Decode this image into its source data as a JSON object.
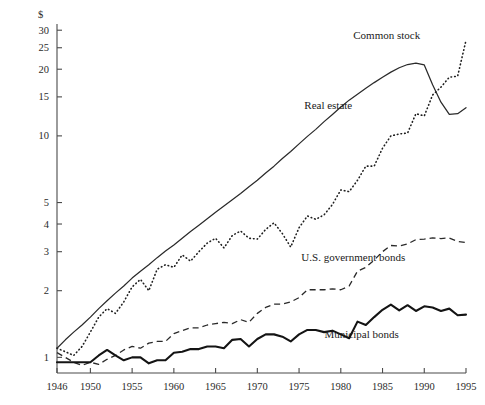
{
  "chart_data": {
    "type": "line",
    "title": "",
    "subtitle": "",
    "xlabel": "",
    "ylabel": "$",
    "yscale": "log",
    "ylim": [
      0.85,
      32
    ],
    "xlim": [
      1946,
      1995
    ],
    "grid": false,
    "legend": "inline-annotations",
    "ytick_labels": [
      "1",
      "2",
      "3",
      "4",
      "5",
      "10",
      "15",
      "20",
      "25",
      "30"
    ],
    "ytick_values": [
      1,
      2,
      3,
      4,
      5,
      10,
      15,
      20,
      25,
      30
    ],
    "xtick_labels": [
      "1946",
      "1950",
      "1955",
      "1960",
      "1965",
      "1970",
      "1975",
      "1980",
      "1985",
      "1990",
      "1995"
    ],
    "xtick_values": [
      1946,
      1950,
      1955,
      1960,
      1965,
      1970,
      1975,
      1980,
      1985,
      1990,
      1995
    ],
    "x": [
      1946,
      1947,
      1948,
      1949,
      1950,
      1951,
      1952,
      1953,
      1954,
      1955,
      1956,
      1957,
      1958,
      1959,
      1960,
      1961,
      1962,
      1963,
      1964,
      1965,
      1966,
      1967,
      1968,
      1969,
      1970,
      1971,
      1972,
      1973,
      1974,
      1975,
      1976,
      1977,
      1978,
      1979,
      1980,
      1981,
      1982,
      1983,
      1984,
      1985,
      1986,
      1987,
      1988,
      1989,
      1990,
      1991,
      1992,
      1993,
      1994,
      1995
    ],
    "series": [
      {
        "name": "Common stock",
        "style": "dotted",
        "label_x": 1985.5,
        "label_y": 27.5,
        "values": [
          1.1,
          1.06,
          1.02,
          1.12,
          1.3,
          1.52,
          1.66,
          1.58,
          1.78,
          2.08,
          2.25,
          2.0,
          2.5,
          2.62,
          2.55,
          2.9,
          2.72,
          3.0,
          3.28,
          3.45,
          3.12,
          3.55,
          3.72,
          3.45,
          3.42,
          3.78,
          4.05,
          3.62,
          3.15,
          3.85,
          4.35,
          4.2,
          4.4,
          4.9,
          5.7,
          5.6,
          6.3,
          7.3,
          7.3,
          8.8,
          10.0,
          10.2,
          10.3,
          12.6,
          12.3,
          15.3,
          16.6,
          18.4,
          18.6,
          27.0
        ]
      },
      {
        "name": "Real estate",
        "style": "solid-thin",
        "label_x": 1978.5,
        "label_y": 13.2,
        "values": [
          1.1,
          1.2,
          1.3,
          1.4,
          1.52,
          1.66,
          1.8,
          1.95,
          2.1,
          2.28,
          2.45,
          2.62,
          2.82,
          3.02,
          3.22,
          3.45,
          3.7,
          3.95,
          4.22,
          4.52,
          4.82,
          5.15,
          5.5,
          5.9,
          6.3,
          6.8,
          7.3,
          7.9,
          8.5,
          9.2,
          9.95,
          10.7,
          11.6,
          12.5,
          13.5,
          14.5,
          15.4,
          16.4,
          17.4,
          18.4,
          19.4,
          20.3,
          21.0,
          21.3,
          20.9,
          17.0,
          14.2,
          12.5,
          12.6,
          13.4
        ]
      },
      {
        "name": "U.S. government bonds",
        "style": "dashed",
        "label_x": 1981.5,
        "label_y": 2.72,
        "values": [
          1.05,
          1.0,
          0.95,
          0.92,
          0.95,
          0.93,
          0.98,
          1.02,
          1.08,
          1.12,
          1.1,
          1.16,
          1.18,
          1.18,
          1.28,
          1.32,
          1.36,
          1.36,
          1.4,
          1.42,
          1.44,
          1.42,
          1.48,
          1.44,
          1.58,
          1.68,
          1.74,
          1.74,
          1.78,
          1.86,
          2.02,
          2.02,
          2.02,
          2.04,
          2.02,
          2.1,
          2.45,
          2.55,
          2.75,
          3.0,
          3.2,
          3.18,
          3.25,
          3.4,
          3.42,
          3.46,
          3.44,
          3.46,
          3.34,
          3.3
        ]
      },
      {
        "name": "Municipal bonds",
        "style": "solid-thick",
        "label_x": 1982.5,
        "label_y": 1.22,
        "values": [
          0.95,
          0.95,
          0.95,
          0.95,
          0.95,
          1.02,
          1.08,
          1.02,
          0.97,
          1.0,
          1.0,
          0.94,
          0.97,
          0.97,
          1.05,
          1.06,
          1.09,
          1.09,
          1.12,
          1.12,
          1.1,
          1.2,
          1.21,
          1.12,
          1.21,
          1.27,
          1.27,
          1.24,
          1.18,
          1.27,
          1.33,
          1.33,
          1.3,
          1.32,
          1.27,
          1.22,
          1.45,
          1.4,
          1.52,
          1.64,
          1.73,
          1.63,
          1.72,
          1.62,
          1.7,
          1.68,
          1.62,
          1.66,
          1.55,
          1.56
        ]
      }
    ]
  }
}
